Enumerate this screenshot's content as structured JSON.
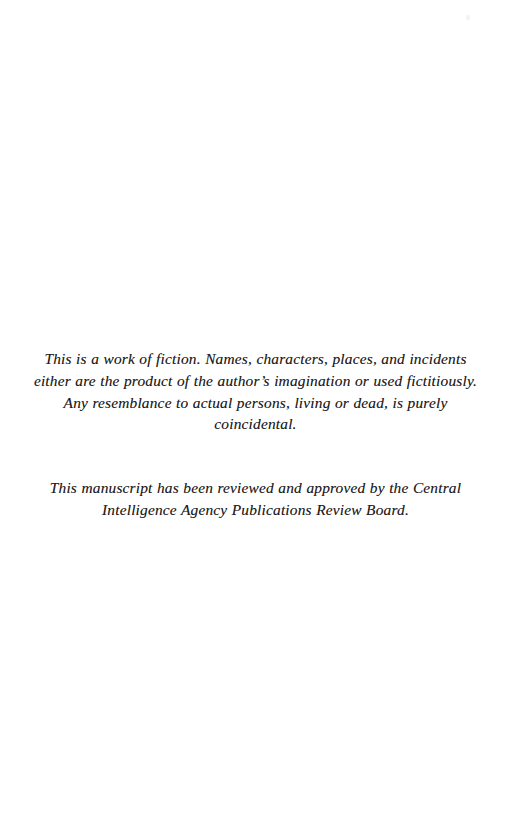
{
  "page": {
    "kind": "book-front-matter-page",
    "background_color": "#ffffff",
    "text_color": "#1e1b1b",
    "width": 511,
    "height": 828
  },
  "body": {
    "disclaimer": "This is a work of fiction. Names, characters, places, and incidents either are the product of the author’s imagination or used fictitiously. Any resemblance to actual persons, living or dead, is purely coincidental.",
    "clearance_notice": "This manuscript has been reviewed and approved by the Central Intelligence Agency Publications Review Board."
  },
  "artifacts": {
    "scan_speck_label": ""
  }
}
